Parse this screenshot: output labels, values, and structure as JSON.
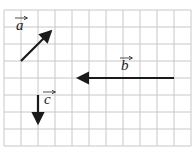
{
  "diagram": {
    "type": "vectors-on-grid",
    "grid": {
      "columns": 11,
      "rows": 8,
      "cell_px": 17,
      "origin_px": [
        4,
        10
      ],
      "line_color": "#c8c8c8"
    },
    "vectors": [
      {
        "name": "a",
        "label": "a",
        "from_cell": [
          1,
          3
        ],
        "to_cell": [
          3,
          1
        ],
        "components": [
          2,
          2
        ]
      },
      {
        "name": "b",
        "label": "b",
        "from_cell": [
          10,
          4
        ],
        "to_cell": [
          4,
          4
        ],
        "components": [
          -6,
          0
        ]
      },
      {
        "name": "c",
        "label": "c",
        "from_cell": [
          2,
          5
        ],
        "to_cell": [
          2,
          7
        ],
        "components": [
          0,
          -2
        ]
      }
    ],
    "arrow_color": "#1a1a1a"
  }
}
